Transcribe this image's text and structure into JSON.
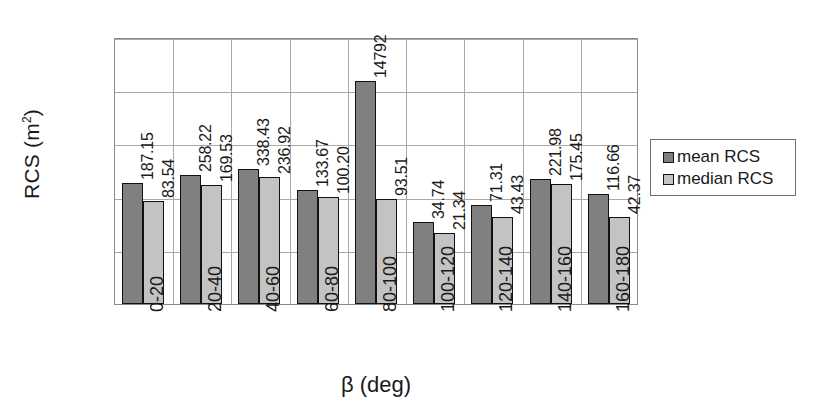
{
  "chart_data": {
    "type": "bar",
    "title": "",
    "xlabel": "β (deg)",
    "ylabel": "RCS (m²)",
    "ylabel_base": "RCS (m",
    "ylabel_sup": "2",
    "ylabel_close": ")",
    "yscale": "log",
    "ylim": [
      1,
      100000
    ],
    "yticks": [
      1,
      10,
      100,
      1000,
      10000,
      100000
    ],
    "ytick_labels": [
      "1",
      "10",
      "100",
      "1000",
      "10000",
      "100000"
    ],
    "grid": true,
    "legend_position": "right",
    "categories": [
      "0-20",
      "20-40",
      "40-60",
      "60-80",
      "80-100",
      "100-120",
      "120-140",
      "140-160",
      "160-180"
    ],
    "series": [
      {
        "name": "mean RCS",
        "color": "#808080",
        "values": [
          187.15,
          258.22,
          338.43,
          133.67,
          14792,
          34.74,
          71.31,
          221.98,
          116.66
        ],
        "labels": [
          "187.15",
          "258.22",
          "338.43",
          "133.67",
          "14792",
          "34.74",
          "71.31",
          "221.98",
          "116.66"
        ]
      },
      {
        "name": "median RCS",
        "color": "#c3c3c3",
        "values": [
          83.54,
          169.53,
          236.92,
          100.2,
          93.51,
          21.34,
          43.43,
          175.45,
          42.37
        ],
        "labels": [
          "83.54",
          "169.53",
          "236.92",
          "100.20",
          "93.51",
          "21.34",
          "43.43",
          "175.45",
          "42.37"
        ]
      }
    ]
  },
  "legend": {
    "items": [
      {
        "label": "mean RCS",
        "color": "#808080"
      },
      {
        "label": "median RCS",
        "color": "#c3c3c3"
      }
    ]
  }
}
